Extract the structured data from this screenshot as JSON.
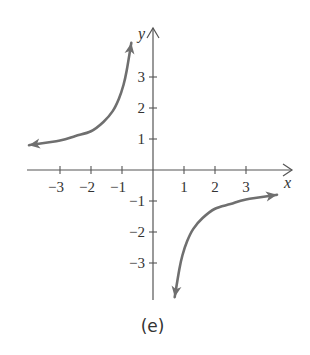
{
  "chart_data": {
    "type": "line",
    "title": "",
    "caption": "(e)",
    "xlabel": "x",
    "ylabel": "y",
    "xlim": [
      -4,
      4
    ],
    "ylim": [
      -4,
      4
    ],
    "grid": false,
    "x_ticks": [
      -3,
      -2,
      -1,
      1,
      2,
      3
    ],
    "x_tick_labels": [
      "−3",
      "−2",
      "−1",
      "1",
      "2",
      "3"
    ],
    "y_ticks": [
      -3,
      -2,
      -1,
      1,
      2,
      3
    ],
    "y_tick_labels": [
      "−3",
      "−2",
      "−1",
      "1",
      "2",
      "3"
    ],
    "series": [
      {
        "name": "branch-left",
        "x": [
          -4.0,
          -3.0,
          -2.5,
          -2.0,
          -1.6,
          -1.3,
          -1.1,
          -0.95,
          -0.85,
          -0.7
        ],
        "y": [
          0.8,
          0.95,
          1.1,
          1.25,
          1.55,
          1.9,
          2.3,
          2.75,
          3.2,
          4.1
        ],
        "arrows": "both"
      },
      {
        "name": "branch-right",
        "x": [
          0.7,
          0.85,
          0.95,
          1.1,
          1.3,
          1.6,
          2.0,
          2.5,
          3.0,
          4.0
        ],
        "y": [
          -4.1,
          -3.2,
          -2.75,
          -2.3,
          -1.9,
          -1.55,
          -1.25,
          -1.1,
          -0.95,
          -0.8
        ],
        "arrows": "both"
      }
    ],
    "colors": {
      "curve": "#6f6f6f",
      "axes": "#555555"
    }
  }
}
